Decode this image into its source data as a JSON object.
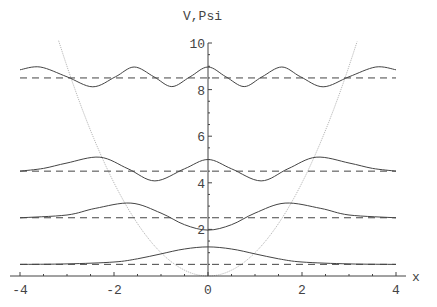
{
  "chart_data": {
    "type": "line",
    "title": "",
    "xlabel": "x",
    "ylabel": "V,Psi",
    "xlim": [
      -4,
      4
    ],
    "ylim": [
      0,
      10
    ],
    "grid": false,
    "legend": null,
    "x_ticks": [
      "-4",
      "-2",
      "0",
      "2",
      "4"
    ],
    "x_tick_values": [
      -4,
      -2,
      0,
      2,
      4
    ],
    "y_ticks": [
      "2",
      "4",
      "6",
      "8",
      "10"
    ],
    "y_tick_values": [
      2,
      4,
      6,
      8,
      10
    ],
    "potential": {
      "name": "V(x) = x^2",
      "color": "#b8b8b8",
      "style": "dotted"
    },
    "energy_levels": {
      "values": [
        0.5,
        2.5,
        4.5,
        8.5
      ],
      "color": "#444444",
      "style": "dashed"
    },
    "series": [
      {
        "name": "Psi0",
        "color": "#444444",
        "x": [
          -4,
          -3,
          -2,
          -1.5,
          -1,
          -0.5,
          0,
          0.5,
          1,
          1.5,
          2,
          3,
          4
        ],
        "y": [
          0.5,
          0.52,
          0.6,
          0.74,
          0.95,
          1.16,
          1.25,
          1.16,
          0.95,
          0.74,
          0.6,
          0.52,
          0.5
        ]
      },
      {
        "name": "Psi1",
        "color": "#444444",
        "x": [
          -4,
          -3,
          -2.4,
          -1.64,
          -1.0,
          -0.5,
          0,
          0.5,
          1.0,
          1.64,
          2.4,
          3,
          4
        ],
        "y": [
          2.5,
          2.62,
          2.9,
          3.13,
          2.7,
          2.2,
          1.97,
          2.2,
          2.7,
          3.13,
          2.9,
          2.62,
          2.5
        ]
      },
      {
        "name": "Psi2",
        "color": "#444444",
        "x": [
          -4,
          -3.5,
          -3,
          -2.3,
          -1.7,
          -1.13,
          -0.5,
          0,
          0.5,
          1.13,
          1.7,
          2.3,
          3,
          3.5,
          4
        ],
        "y": [
          4.5,
          4.62,
          4.85,
          5.1,
          4.6,
          4.08,
          4.6,
          5.0,
          4.6,
          4.08,
          4.6,
          5.1,
          4.85,
          4.62,
          4.5
        ]
      },
      {
        "name": "Psi4",
        "color": "#444444",
        "x": [
          -4,
          -3.57,
          -3.0,
          -2.45,
          -1.97,
          -1.57,
          -1.15,
          -0.77,
          -0.38,
          0,
          0.38,
          0.77,
          1.15,
          1.57,
          1.97,
          2.45,
          3.0,
          3.57,
          4
        ],
        "y": [
          8.85,
          8.97,
          8.55,
          8.12,
          8.55,
          8.97,
          8.55,
          8.13,
          8.55,
          8.97,
          8.55,
          8.13,
          8.55,
          8.97,
          8.55,
          8.12,
          8.55,
          8.97,
          8.85
        ]
      }
    ]
  }
}
